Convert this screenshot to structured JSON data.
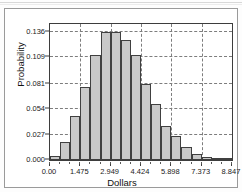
{
  "figure": {
    "background_color": "#ffffff",
    "frame_color": "#9a9a9a",
    "axis_color": "#3d3d3d",
    "grid_color": "#7d7d7d",
    "bar_fill_color": "#c9c9c9",
    "bar_edge_color": "#404040"
  },
  "chart_data": {
    "type": "bar",
    "title": "",
    "subtitle": "",
    "xlabel": "Dollars",
    "ylabel": "Probability",
    "grid": true,
    "legend": null,
    "xlim": [
      0.0,
      8.847
    ],
    "ylim": [
      0.0,
      0.1445
    ],
    "xticks": [
      0.0,
      1.475,
      2.949,
      4.424,
      5.898,
      7.373,
      8.847
    ],
    "xtick_labels": [
      "0.00",
      "1.475",
      "2.949",
      "4.424",
      "5.898",
      "7.373",
      "8.847"
    ],
    "yticks": [
      0.0,
      0.027,
      0.054,
      0.081,
      0.109,
      0.136
    ],
    "ytick_labels": [
      "0.000",
      "0.027",
      "0.054",
      "0.081",
      "0.109",
      "0.136"
    ],
    "bin_width": 0.4915,
    "bin_edges": [
      0.0,
      0.4915,
      0.983,
      1.4745,
      1.966,
      2.4575,
      2.949,
      3.4405,
      3.932,
      4.4235,
      4.915,
      5.4065,
      5.898,
      6.3895,
      6.881,
      7.3725,
      7.864,
      8.3555,
      8.847
    ],
    "categories": [
      "0.246",
      "0.737",
      "1.229",
      "1.720",
      "2.212",
      "2.703",
      "3.195",
      "3.686",
      "4.178",
      "4.669",
      "5.161",
      "5.652",
      "6.144",
      "6.635",
      "7.127",
      "7.618",
      "8.110",
      "8.601"
    ],
    "values": [
      0.004,
      0.019,
      0.047,
      0.078,
      0.112,
      0.136,
      0.136,
      0.127,
      0.112,
      0.081,
      0.059,
      0.036,
      0.026,
      0.014,
      0.006,
      0.003,
      0.001,
      0.0005
    ]
  }
}
